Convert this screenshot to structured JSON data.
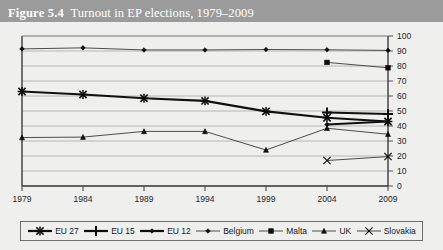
{
  "figure": {
    "number": "Figure 5.4",
    "caption": "Turnout in EP elections, 1979–2009"
  },
  "colors": {
    "titlebar_bg": "#9b9b9b",
    "titlebar_text": "#ffffff",
    "page_bg": "#efefee",
    "axis": "#555555",
    "grid": "#a8a8a8",
    "series_bold": "#111111",
    "series_thin": "#3a3a3a",
    "legend_border": "#6f6f6f"
  },
  "chart_data": {
    "type": "line",
    "title": "Turnout in EP elections, 1979–2009",
    "xlabel": "",
    "ylabel": "",
    "x": [
      1979,
      1984,
      1989,
      1994,
      1999,
      2004,
      2009
    ],
    "categories": [
      "1979",
      "1984",
      "1989",
      "1994",
      "1999",
      "2004",
      "2009"
    ],
    "ylim": [
      0,
      100
    ],
    "yticks": [
      0,
      10,
      20,
      30,
      40,
      50,
      60,
      70,
      80,
      90,
      100
    ],
    "ytick_labels": [
      "0",
      "10",
      "20",
      "30",
      "40",
      "50",
      "60",
      "70",
      "80",
      "90",
      "100"
    ],
    "y_axis_position": "right",
    "grid": true,
    "legend_position": "bottom",
    "series": [
      {
        "name": "EU 27",
        "marker": "asterisk",
        "weight": "bold",
        "x": [
          1979,
          1984,
          1989,
          1994,
          1999,
          2004,
          2009
        ],
        "values": [
          63.0,
          61.0,
          58.5,
          56.7,
          49.8,
          45.5,
          43.0
        ]
      },
      {
        "name": "EU 15",
        "marker": "plus",
        "weight": "bold",
        "x": [
          2004,
          2009
        ],
        "values": [
          49.0,
          48.0
        ]
      },
      {
        "name": "EU 12",
        "marker": "diamond",
        "weight": "bold",
        "x": [
          2004,
          2009
        ],
        "values": [
          41.0,
          43.0
        ]
      },
      {
        "name": "Belgium",
        "marker": "diamond",
        "weight": "thin",
        "x": [
          1979,
          1984,
          1989,
          1994,
          1999,
          2004,
          2009
        ],
        "values": [
          91.4,
          92.1,
          90.7,
          90.7,
          91.0,
          90.8,
          90.4
        ]
      },
      {
        "name": "Malta",
        "marker": "square",
        "weight": "thin",
        "x": [
          2004,
          2009
        ],
        "values": [
          82.4,
          78.8
        ]
      },
      {
        "name": "UK",
        "marker": "triangle",
        "weight": "thin",
        "x": [
          1979,
          1984,
          1989,
          1994,
          1999,
          2004,
          2009
        ],
        "values": [
          32.3,
          32.6,
          36.4,
          36.4,
          24.0,
          38.5,
          34.5
        ]
      },
      {
        "name": "Slovakia",
        "marker": "x",
        "weight": "thin",
        "x": [
          2004,
          2009
        ],
        "values": [
          17.0,
          19.6
        ]
      }
    ]
  },
  "legend": {
    "items": [
      {
        "label": "EU 27",
        "marker": "asterisk",
        "weight": "bold"
      },
      {
        "label": "EU 15",
        "marker": "plus",
        "weight": "bold"
      },
      {
        "label": "EU 12",
        "marker": "diamond",
        "weight": "bold"
      },
      {
        "label": "Belgium",
        "marker": "diamond",
        "weight": "thin"
      },
      {
        "label": "Malta",
        "marker": "square",
        "weight": "thin"
      },
      {
        "label": "UK",
        "marker": "triangle",
        "weight": "thin"
      },
      {
        "label": "Slovakia",
        "marker": "x",
        "weight": "thin"
      }
    ]
  }
}
